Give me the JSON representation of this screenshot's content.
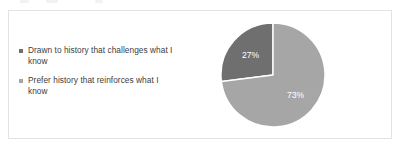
{
  "card": {
    "border_color": "#e3e3e4",
    "background": "#ffffff"
  },
  "legend": {
    "items": [
      {
        "label": "Drawn to history that challenges what I know",
        "color": "#6f6f6f",
        "marker": "square-marker"
      },
      {
        "label": "Prefer history that reinforces what I know",
        "color": "#a6a6a6",
        "marker": "square-marker"
      }
    ]
  },
  "chart_data": {
    "type": "pie",
    "title": "",
    "subtitle": "",
    "xlabel": "",
    "ylabel": "",
    "grid": false,
    "legend_position": "left",
    "start_angle_deg": 0,
    "direction": "counter-clockwise",
    "categories": [
      "Drawn to history that challenges what I know",
      "Prefer history that reinforces what I know"
    ],
    "values": [
      27,
      73
    ],
    "value_unit": "%",
    "data_labels": [
      "27%",
      "73%"
    ],
    "data_label_color": "#ffffff",
    "slice_colors": [
      "#6f6f6f",
      "#a6a6a6"
    ],
    "slice_separator_color": "#ffffff"
  }
}
